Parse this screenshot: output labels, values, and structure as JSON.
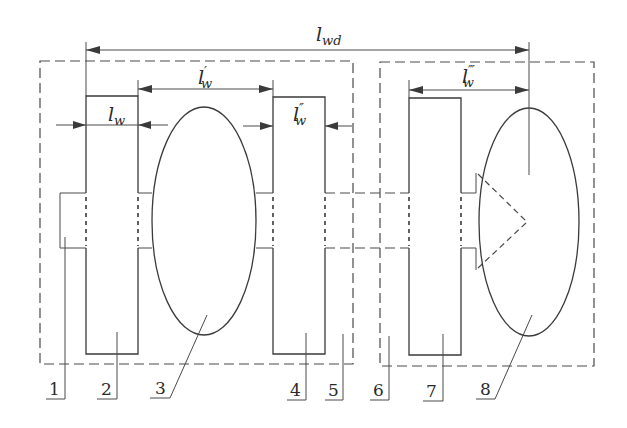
{
  "diagram": {
    "type": "mechanical-schematic",
    "dimensions": [
      {
        "id": "lwd",
        "base": "l",
        "subscript": "wd",
        "primes": ""
      },
      {
        "id": "lw",
        "base": "l",
        "subscript": "w",
        "primes": ""
      },
      {
        "id": "lw1",
        "base": "l",
        "subscript": "w",
        "primes": "′"
      },
      {
        "id": "lw2",
        "base": "l",
        "subscript": "w",
        "primes": "″"
      },
      {
        "id": "lw3",
        "base": "l",
        "subscript": "w",
        "primes": "‴"
      }
    ],
    "callouts": [
      "1",
      "2",
      "3",
      "4",
      "5",
      "6",
      "7",
      "8"
    ],
    "colors": {
      "line": "#3a3a3a",
      "background": "#ffffff"
    }
  }
}
